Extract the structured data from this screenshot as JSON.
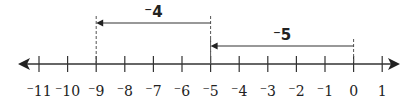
{
  "diagram": {
    "type": "number-line",
    "range": [
      -11,
      1
    ],
    "ticks": [
      {
        "value": -11,
        "label": "⁻11"
      },
      {
        "value": -10,
        "label": "⁻10"
      },
      {
        "value": -9,
        "label": "⁻9"
      },
      {
        "value": -8,
        "label": "⁻8"
      },
      {
        "value": -7,
        "label": "⁻7"
      },
      {
        "value": -6,
        "label": "⁻6"
      },
      {
        "value": -5,
        "label": "⁻5"
      },
      {
        "value": -4,
        "label": "⁻4"
      },
      {
        "value": -3,
        "label": "⁻3"
      },
      {
        "value": -2,
        "label": "⁻2"
      },
      {
        "value": -1,
        "label": "⁻1"
      },
      {
        "value": 0,
        "label": "0"
      },
      {
        "value": 1,
        "label": "1"
      }
    ],
    "jumps": [
      {
        "from": 0,
        "to": -5,
        "label": "⁻5",
        "level": "lower"
      },
      {
        "from": -5,
        "to": -9,
        "label": "⁻4",
        "level": "upper"
      }
    ],
    "colors": {
      "line": "#333333",
      "text": "#222222",
      "background": "#ffffff"
    }
  }
}
